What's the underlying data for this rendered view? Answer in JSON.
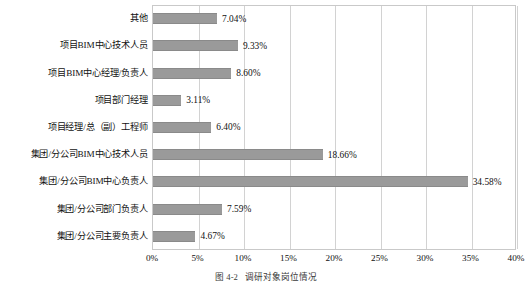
{
  "chart_data": {
    "type": "bar",
    "orientation": "horizontal",
    "title": "",
    "xlabel": "",
    "ylabel": "",
    "xlim": [
      0,
      40
    ],
    "grid": true,
    "legend": false,
    "bar_color": "#9a9a9a",
    "frame_color": "#c9c9c9",
    "gridline_color": "#d2d2d2",
    "xticks": [
      "0%",
      "5%",
      "10%",
      "15%",
      "20%",
      "25%",
      "30%",
      "35%",
      "40%"
    ],
    "xtick_values": [
      0,
      5,
      10,
      15,
      20,
      25,
      30,
      35,
      40
    ],
    "categories": [
      "其他",
      "项目BIM中心技术人员",
      "项目BIM中心经理/负责人",
      "项目部门经理",
      "项目经理/总（副）工程师",
      "集团/分公司BIM中心技术人员",
      "集团/分公司BIM中心负责人",
      "集团/分公司部门负责人",
      "集团/分公司主要负责人"
    ],
    "values": [
      7.04,
      9.33,
      8.6,
      3.11,
      6.4,
      18.66,
      34.58,
      7.59,
      4.67
    ],
    "value_labels": [
      "7.04%",
      "9.33%",
      "8.60%",
      "3.11%",
      "6.40%",
      "18.66%",
      "34.58%",
      "7.59%",
      "4.67%"
    ]
  },
  "caption": {
    "number": "图 4-2",
    "text": "调研对象岗位情况"
  }
}
